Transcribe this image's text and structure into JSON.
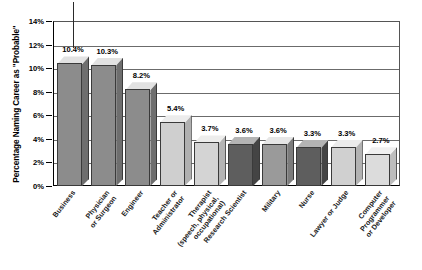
{
  "chart_data": {
    "type": "bar",
    "title": "",
    "subtitle": "",
    "xlabel": "",
    "ylabel": "Percentage Naming Career as \"Probable\"",
    "ylim": [
      0,
      14
    ],
    "ytick_values": [
      0,
      2,
      4,
      6,
      8,
      10,
      12,
      14
    ],
    "ytick_labels": [
      "0%",
      "2%",
      "4%",
      "6%",
      "8%",
      "10%",
      "12%",
      "14%"
    ],
    "grid": true,
    "legend": "none",
    "style": "3d-bar",
    "categories": [
      "Business",
      "Physician or Surgeon",
      "Engineer",
      "Teacher or Administrator",
      "Therapist (speech, physical, occupational)",
      "Research Scientist",
      "Military",
      "Nurse",
      "Lawyer or Judge",
      "Computer Programmer or Developer"
    ],
    "category_lines": [
      [
        "Business"
      ],
      [
        "Physician",
        "or Surgeon"
      ],
      [
        "Engineer"
      ],
      [
        "Teacher or",
        "Administrator"
      ],
      [
        "Therapist",
        "(speech, physical,",
        "occupational)"
      ],
      [
        "Research Scientist"
      ],
      [
        "Military"
      ],
      [
        "Nurse"
      ],
      [
        "Lawyer or Judge"
      ],
      [
        "Computer",
        "Programmer",
        "or Developer"
      ]
    ],
    "values": [
      10.4,
      10.3,
      8.2,
      5.4,
      3.7,
      3.6,
      3.6,
      3.3,
      3.3,
      2.7
    ],
    "value_labels": [
      "10.4%",
      "10.3%",
      "8.2%",
      "5.4%",
      "3.7%",
      "3.6%",
      "3.6%",
      "3.3%",
      "3.3%",
      "2.7%"
    ],
    "bar_colors": [
      "#8c8c8c",
      "#8c8c8c",
      "#8c8c8c",
      "#cfcfcf",
      "#d4d4d4",
      "#5e5e5e",
      "#9a9a9a",
      "#5e5e5e",
      "#d0d0d0",
      "#dcdcdc"
    ],
    "bar_top_colors": [
      "#e2e2e2",
      "#e2e2e2",
      "#e2e2e2",
      "#ececec",
      "#ededec",
      "#b4b4b4",
      "#e6e6e6",
      "#b4b4b4",
      "#ebebeb",
      "#f0f0f0"
    ],
    "bar_side_colors": [
      "#6e6e6e",
      "#6e6e6e",
      "#6e6e6e",
      "#b0b0b0",
      "#b4b4b4",
      "#444444",
      "#7c7c7c",
      "#444444",
      "#b2b2b2",
      "#bdbdbd"
    ]
  },
  "axis": {
    "y_title": "Percentage Naming Career as \"Probable\""
  }
}
